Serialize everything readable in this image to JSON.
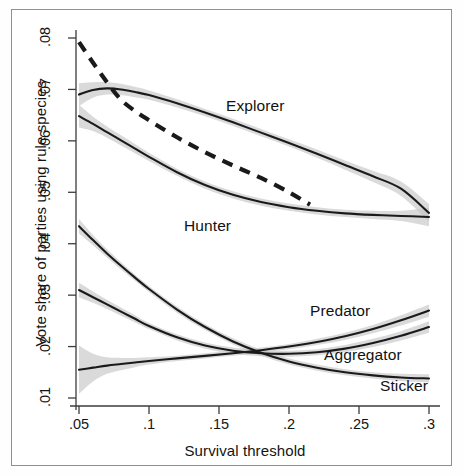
{
  "chart_data": {
    "type": "line",
    "title": "",
    "xlabel": "Survival threshold",
    "ylabel": "Vote share of  parties using rule species",
    "xlim": [
      0.045,
      0.305
    ],
    "ylim": [
      0.0085,
      0.0815
    ],
    "xticks": [
      ".05",
      ".1",
      ".15",
      ".2",
      ".25",
      ".3"
    ],
    "xtick_values": [
      0.05,
      0.1,
      0.15,
      0.2,
      0.25,
      0.3
    ],
    "yticks": [
      ".01",
      ".02",
      ".03",
      ".04",
      ".05",
      ".06",
      ".07",
      ".08"
    ],
    "ytick_values": [
      0.01,
      0.02,
      0.03,
      0.04,
      0.05,
      0.06,
      0.07,
      0.08
    ],
    "grid": false,
    "legend_position": "inline-annotations",
    "band_color": "#c4c4c4",
    "line_color": "#1a1a1a",
    "series": [
      {
        "name": "Explorer",
        "style": "solid-with-band",
        "label_x": 0.155,
        "label_y": 0.0665,
        "x": [
          0.05,
          0.06,
          0.07,
          0.08,
          0.09,
          0.1,
          0.12,
          0.14,
          0.16,
          0.18,
          0.2,
          0.22,
          0.24,
          0.26,
          0.28,
          0.3
        ],
        "values": [
          0.069,
          0.0699,
          0.0702,
          0.07,
          0.0695,
          0.0689,
          0.0673,
          0.0655,
          0.0636,
          0.0616,
          0.0596,
          0.0575,
          0.0553,
          0.0531,
          0.0507,
          0.046
        ],
        "band_lower": [
          0.0668,
          0.0684,
          0.069,
          0.0689,
          0.0685,
          0.068,
          0.0665,
          0.0648,
          0.0629,
          0.0609,
          0.0589,
          0.0567,
          0.0544,
          0.052,
          0.0493,
          0.0443
        ],
        "band_upper": [
          0.0712,
          0.0714,
          0.0714,
          0.0711,
          0.0705,
          0.0698,
          0.0681,
          0.0662,
          0.0643,
          0.0623,
          0.0603,
          0.0583,
          0.0562,
          0.0542,
          0.0521,
          0.0477
        ]
      },
      {
        "name": "Hunter",
        "style": "solid-with-band",
        "label_x": 0.125,
        "label_y": 0.0432,
        "x": [
          0.05,
          0.06,
          0.07,
          0.08,
          0.09,
          0.1,
          0.12,
          0.14,
          0.16,
          0.18,
          0.2,
          0.22,
          0.24,
          0.26,
          0.28,
          0.3
        ],
        "values": [
          0.0648,
          0.0633,
          0.0617,
          0.0601,
          0.0585,
          0.0569,
          0.0539,
          0.0514,
          0.0495,
          0.0481,
          0.0471,
          0.0464,
          0.0459,
          0.0456,
          0.0454,
          0.0452
        ],
        "band_lower": [
          0.0626,
          0.0619,
          0.0606,
          0.0591,
          0.0576,
          0.0561,
          0.0532,
          0.0507,
          0.0488,
          0.0474,
          0.0464,
          0.0457,
          0.0452,
          0.0448,
          0.0444,
          0.0434
        ],
        "band_upper": [
          0.067,
          0.0647,
          0.0628,
          0.0611,
          0.0594,
          0.0577,
          0.0546,
          0.0521,
          0.0502,
          0.0488,
          0.0478,
          0.0471,
          0.0466,
          0.0464,
          0.0464,
          0.047
        ]
      },
      {
        "name": "Predator",
        "style": "solid-with-band",
        "label_x": 0.215,
        "label_y": 0.0268,
        "x": [
          0.05,
          0.06,
          0.07,
          0.08,
          0.09,
          0.1,
          0.12,
          0.14,
          0.16,
          0.18,
          0.2,
          0.22,
          0.24,
          0.26,
          0.28,
          0.3
        ],
        "values": [
          0.0434,
          0.0407,
          0.0381,
          0.0357,
          0.0334,
          0.0312,
          0.0272,
          0.0238,
          0.021,
          0.0188,
          0.0171,
          0.0159,
          0.015,
          0.0144,
          0.014,
          0.0138
        ],
        "band_lower": [
          0.042,
          0.0397,
          0.0373,
          0.035,
          0.0328,
          0.0306,
          0.0266,
          0.0232,
          0.0204,
          0.0182,
          0.0165,
          0.0153,
          0.0144,
          0.0138,
          0.0133,
          0.013
        ],
        "band_upper": [
          0.0448,
          0.0417,
          0.0389,
          0.0364,
          0.034,
          0.0318,
          0.0278,
          0.0244,
          0.0216,
          0.0194,
          0.0177,
          0.0165,
          0.0156,
          0.015,
          0.0147,
          0.0146
        ]
      },
      {
        "name": "Aggregator",
        "style": "solid-with-band",
        "label_x": 0.225,
        "label_y": 0.0182,
        "x": [
          0.05,
          0.06,
          0.07,
          0.08,
          0.09,
          0.1,
          0.12,
          0.14,
          0.16,
          0.18,
          0.2,
          0.22,
          0.24,
          0.26,
          0.28,
          0.3
        ],
        "values": [
          0.031,
          0.0296,
          0.0282,
          0.0268,
          0.0254,
          0.024,
          0.0218,
          0.0202,
          0.0192,
          0.0187,
          0.0186,
          0.0189,
          0.0196,
          0.0207,
          0.0221,
          0.0238
        ],
        "band_lower": [
          0.0296,
          0.0285,
          0.0273,
          0.026,
          0.0247,
          0.0234,
          0.0212,
          0.0196,
          0.0186,
          0.0181,
          0.018,
          0.0183,
          0.0189,
          0.0199,
          0.0212,
          0.0227
        ],
        "band_upper": [
          0.0324,
          0.0307,
          0.0291,
          0.0276,
          0.0261,
          0.0246,
          0.0224,
          0.0208,
          0.0198,
          0.0193,
          0.0192,
          0.0195,
          0.0203,
          0.0215,
          0.023,
          0.0249
        ]
      },
      {
        "name": "Sticker",
        "style": "solid-with-band",
        "label_x": 0.265,
        "label_y": 0.0122,
        "x": [
          0.05,
          0.06,
          0.07,
          0.08,
          0.09,
          0.1,
          0.12,
          0.14,
          0.16,
          0.18,
          0.2,
          0.22,
          0.24,
          0.26,
          0.28,
          0.3
        ],
        "values": [
          0.0155,
          0.0159,
          0.0163,
          0.0166,
          0.0169,
          0.0172,
          0.0177,
          0.0182,
          0.0187,
          0.0193,
          0.02,
          0.0209,
          0.022,
          0.0234,
          0.0251,
          0.027
        ],
        "band_lower": [
          0.0108,
          0.0132,
          0.0147,
          0.0154,
          0.016,
          0.0165,
          0.0172,
          0.0177,
          0.0182,
          0.0188,
          0.0195,
          0.0203,
          0.0213,
          0.0226,
          0.0241,
          0.0258
        ],
        "band_upper": [
          0.0202,
          0.0186,
          0.0179,
          0.0178,
          0.0178,
          0.0179,
          0.0182,
          0.0187,
          0.0192,
          0.0198,
          0.0205,
          0.0215,
          0.0227,
          0.0242,
          0.0261,
          0.0282
        ]
      },
      {
        "name": "dashed-reference",
        "style": "dashed",
        "label_x": null,
        "label_y": null,
        "x": [
          0.05,
          0.06,
          0.07,
          0.08,
          0.09,
          0.1,
          0.12,
          0.14,
          0.16,
          0.18,
          0.2,
          0.215
        ],
        "values": [
          0.0792,
          0.0752,
          0.0714,
          0.068,
          0.0658,
          0.064,
          0.0607,
          0.0578,
          0.0552,
          0.0528,
          0.05,
          0.0476
        ]
      }
    ]
  }
}
